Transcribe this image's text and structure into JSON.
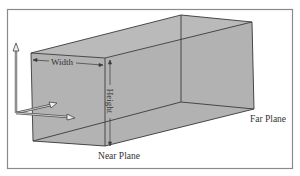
{
  "diagram": {
    "type": "view-frustum",
    "labels": {
      "width": "Width",
      "height": "Height",
      "near_plane": "Near Plane",
      "far_plane": "Far Plane"
    },
    "colors": {
      "frame_border": "#8a8a8a",
      "box_fill": "#b4b4b4",
      "box_fill_top": "#bcbcbc",
      "box_fill_front": "#b0b0b0",
      "edge": "#3a3a3a",
      "text": "#333333",
      "background": "#ffffff"
    },
    "axes": {
      "origin": [
        16,
        113
      ],
      "up_tip": [
        16,
        43
      ],
      "diag_tip": [
        57,
        103
      ],
      "right_tip": [
        75,
        118
      ]
    }
  }
}
